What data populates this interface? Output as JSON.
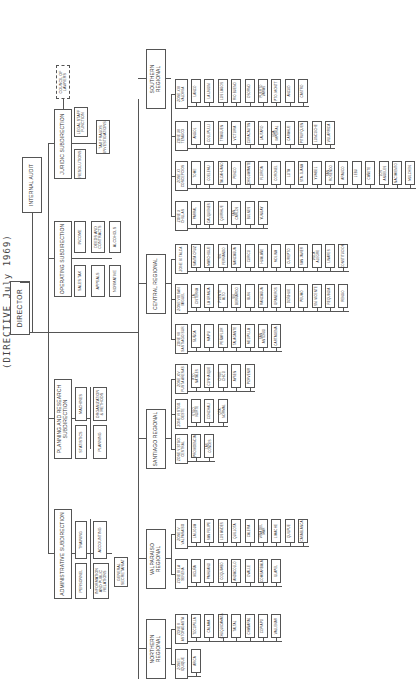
{
  "title": "(DIRECTIVE July 1969)",
  "director": "DIRECTOR",
  "internal_audit": "INTERNAL AUDIT",
  "subdirections": {
    "administrative": {
      "label": "ADMINISTRATIVE SUBDIRECTION",
      "units": [
        "TRAINING",
        "ACCOUNTING",
        "PERSONNEL",
        "INFORMATION AND PUBLIC RELATIONS"
      ],
      "general_secretariat": "GENERAL SECRETARIAT"
    },
    "planning": {
      "label": "PLANNING AND RESEARCH SUBDIRECTION",
      "units": [
        "MACHINES",
        "ORGANIZATION & METHODS",
        "STATISTICS",
        "PLANNING"
      ]
    },
    "operating": {
      "label": "OPERATING SUBDIRECTION",
      "units": [
        "INCOME",
        "DEEDS AND CONTRACTS",
        "ALCOHOLS",
        "SALES TAX",
        "APPEALS",
        "NORMATIVE"
      ]
    },
    "juridic": {
      "label": "JURIDIC SUBDIRECTION",
      "council": "COUNCIL OF LAWYERS",
      "units": [
        "LEGAL STAFF FUNCTION",
        "RESOLUTIONS",
        "TAX FRAUDS INVESTIGATIONS"
      ]
    }
  },
  "regionals": [
    {
      "label": "NORTHERN REGIONAL",
      "zones": [
        {
          "label": "ZONE I IQUIQUE",
          "offices": [
            "ARICA"
          ]
        },
        {
          "label": "ZONE II ANTOFAGASTA",
          "offices": [
            "TOCOPILLA",
            "CALAMA",
            "CHUQUICAMATA",
            "TALTAL",
            "CHAÑARAL",
            "COPIAPO",
            "VALLENAR"
          ]
        }
      ]
    },
    {
      "label": "VALPARAISO REGIONAL",
      "zones": [
        {
          "label": "ZONE III LA SERENA",
          "offices": [
            "VICUÑA",
            "PAIHUANO",
            "COQUIMBO",
            "ANDACOLLO",
            "OVALLE",
            "COMBARBALA",
            "ILLAPEL"
          ]
        },
        {
          "label": "ZONE IV VALPARAISO",
          "offices": [
            "LA LIGUA",
            "SAN FELIPE",
            "LOS ANDES",
            "QUILLOTA",
            "CALERA",
            "VIÑA DEL MAR",
            "LIMACHE",
            "QUILPUE",
            "CASABLANCA"
          ]
        }
      ]
    },
    {
      "label": "SANTIAGO REGIONAL",
      "zones": [
        {
          "label": "ZONE V STGO. CENTRAL",
          "offices": [
            "PROVIDENCIA",
            "LAS CONDES"
          ]
        },
        {
          "label": "ZONE VI STGO. OESTE",
          "offices": [
            "STGO. NORTE",
            "CONCHALI",
            "QTA. NORMAL"
          ]
        },
        {
          "label": "ZONE XIV PUNTA ARENAS",
          "offices": [
            "PTO. NATALES",
            "COYHAIQUE",
            "CHILE CHICO",
            "AYSEN",
            "PORVENIR"
          ]
        }
      ]
    },
    {
      "label": "CENTRAL REGIONAL",
      "zones": [
        {
          "label": "ZONE VII SANTIAGO SUR",
          "offices": [
            "ÑUÑOA",
            "MAIPU",
            "PEÑAFLOR",
            "TALAGANTE",
            "MELIPILLA",
            "SAN ANTONIO",
            "CARTAGENA"
          ]
        },
        {
          "label": "ZONE VIII SAN MIGUEL",
          "offices": [
            "LA CISTERNA",
            "LA GRANJA",
            "PUENTE ALTO",
            "SN. BERNARDO",
            "BUIN",
            "RANCAGUA",
            "GRANEROS",
            "DOÑIHUE",
            "PEUMO",
            "SN. VICENTE",
            "REQUINOA",
            "RENGO"
          ]
        },
        {
          "label": "ZONE IX TALCA",
          "offices": [
            "SANTA CRUZ",
            "MARCHIGUE",
            "SN. FERNANDO",
            "NANCAGUA",
            "CURICO",
            "HUALAÑE",
            "MOLINA",
            "CUREPTO",
            "SAN JAVIER",
            "VILLA ALEGRE",
            "LINARES",
            "CONSTITUCION"
          ]
        }
      ]
    },
    {
      "label": "SOUTHERN REGIONAL",
      "zones": [
        {
          "label": "ZONE X CHILLAN",
          "offices": [
            "PARRAL",
            "CAUQUENES",
            "QUIRIHUE",
            "SAN CARLOS",
            "BULNES",
            "YUNGAY"
          ]
        },
        {
          "label": "ZONE XI CONCEPCION",
          "offices": [
            "TOME",
            "COELEMU",
            "TALCAHUANO",
            "PENCO",
            "CHIGUAYANTE",
            "FLORIDA",
            "CORONEL",
            "LOTA",
            "STA. JUANA",
            "YUMBEL",
            "SAN ROSENDO",
            "ARAUCO",
            "LEBU",
            "CAÑETE",
            "LOS ANGELES",
            "NACIMIENTO",
            "MULCHEN"
          ]
        },
        {
          "label": "ZONE XII TEMUCO",
          "offices": [
            "ANGOL",
            "COLLIPULLI",
            "TRAIGUEN",
            "VICTORIA",
            "CURACAUTIN",
            "LAUTARO",
            "NVA. IMPERIAL",
            "CARAHUE",
            "PITRUFQUEN",
            "LONCOCHE",
            "VILLARRICA"
          ]
        },
        {
          "label": "ZONE XIII VALDIVIA",
          "offices": [
            "LANCO",
            "LA UNION",
            "LOS LAGOS",
            "RIO BUENO",
            "OSORNO",
            "PUERTO VARAS",
            "PTO. MONTT",
            "ANCUD",
            "CASTRO"
          ]
        }
      ]
    }
  ]
}
